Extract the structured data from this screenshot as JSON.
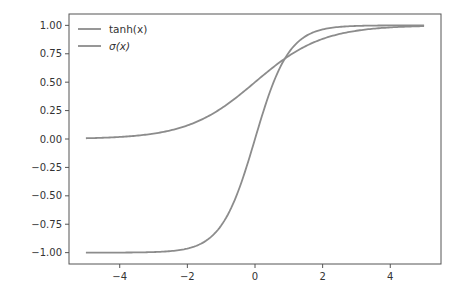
{
  "chart_data": {
    "type": "line",
    "title": "",
    "xlabel": "",
    "ylabel": "",
    "xlim": [
      -5.5,
      5.5
    ],
    "ylim": [
      -1.1,
      1.1
    ],
    "grid": false,
    "legend_position": "upper left",
    "x_ticks": [
      -4,
      -2,
      0,
      2,
      4
    ],
    "x_tick_labels": [
      "−4",
      "−2",
      "0",
      "2",
      "4"
    ],
    "y_ticks": [
      1.0,
      0.75,
      0.5,
      0.25,
      0.0,
      -0.25,
      -0.5,
      -0.75,
      -1.0
    ],
    "y_tick_labels": [
      "1.00",
      "0.75",
      "0.50",
      "0.25",
      "0.00",
      "−0.25",
      "−0.50",
      "−0.75",
      "−1.00"
    ],
    "x": [
      -5,
      -4,
      -3,
      -2,
      -1,
      0,
      1,
      2,
      3,
      4,
      5
    ],
    "series": [
      {
        "name": "tanh(x)",
        "legend_label": "tanh(x)",
        "function": "tanh",
        "color": "#8c8c8c",
        "values": [
          -0.9999,
          -0.9993,
          -0.9951,
          -0.964,
          -0.7616,
          0.0,
          0.7616,
          0.964,
          0.9951,
          0.9993,
          0.9999
        ]
      },
      {
        "name": "σ(x)",
        "legend_label": "σ(x)",
        "function": "sigmoid",
        "color": "#8c8c8c",
        "values": [
          0.0067,
          0.018,
          0.0474,
          0.1192,
          0.2689,
          0.5,
          0.7311,
          0.8808,
          0.9526,
          0.982,
          0.9933
        ]
      }
    ]
  }
}
